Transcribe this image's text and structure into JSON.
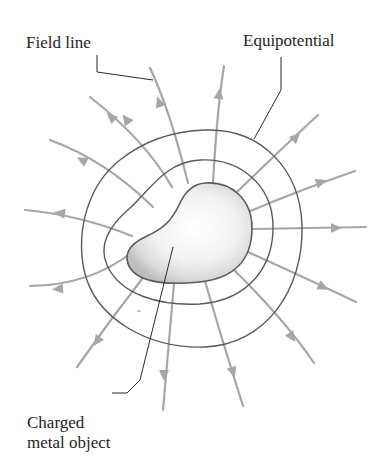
{
  "figure": {
    "labels": {
      "field_line": "Field line",
      "equipotential": "Equipotential",
      "charged_line1": "Charged",
      "charged_line2": "metal object"
    },
    "colors": {
      "field_line": "#a6a6a6",
      "equipotential": "#5a5a5a",
      "leader": "#2a2a2a",
      "object_fill_center": "#ffffff",
      "object_fill_edge": "#c8c8c8",
      "object_outline": "#5a5a5a"
    },
    "field_line_count": 16,
    "equipotential_count": 2
  }
}
